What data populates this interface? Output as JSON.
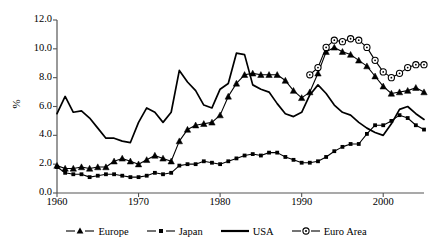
{
  "chart_data": {
    "type": "line",
    "title": "",
    "subtitle": "",
    "xlabel": "",
    "ylabel": "%",
    "xlim": [
      1960,
      2005
    ],
    "ylim": [
      0.0,
      12.0
    ],
    "grid": false,
    "legend_position": "bottom",
    "y_ticks": [
      "0.0",
      "2.0",
      "4.0",
      "6.0",
      "8.0",
      "10.0",
      "12.0"
    ],
    "y_tick_values": [
      0.0,
      2.0,
      4.0,
      6.0,
      8.0,
      10.0,
      12.0
    ],
    "x_ticks": [
      "1960",
      "1970",
      "1980",
      "1990",
      "2000"
    ],
    "x_tick_values": [
      1960,
      1970,
      1980,
      1990,
      2000
    ],
    "series": [
      {
        "name": "Europe",
        "marker": "triangle",
        "color": "#000000",
        "x": [
          1960,
          1961,
          1962,
          1963,
          1964,
          1965,
          1966,
          1967,
          1968,
          1969,
          1970,
          1971,
          1972,
          1973,
          1974,
          1975,
          1976,
          1977,
          1978,
          1979,
          1980,
          1981,
          1982,
          1983,
          1984,
          1985,
          1986,
          1987,
          1988,
          1989,
          1990,
          1991,
          1992,
          1993,
          1994,
          1995,
          1996,
          1997,
          1998,
          1999,
          2000,
          2001,
          2002,
          2003,
          2004,
          2005
        ],
        "values": [
          1.9,
          1.7,
          1.7,
          1.8,
          1.7,
          1.8,
          1.8,
          2.2,
          2.4,
          2.2,
          2.0,
          2.3,
          2.6,
          2.4,
          2.2,
          3.6,
          4.4,
          4.7,
          4.8,
          4.9,
          5.4,
          6.7,
          7.6,
          8.2,
          8.3,
          8.2,
          8.2,
          8.2,
          7.8,
          7.1,
          6.6,
          7.0,
          8.3,
          9.8,
          10.1,
          9.8,
          9.6,
          9.2,
          8.8,
          8.1,
          7.4,
          6.9,
          7.0,
          7.1,
          7.3,
          7.0
        ]
      },
      {
        "name": "Japan",
        "marker": "small-square",
        "color": "#000000",
        "x": [
          1960,
          1961,
          1962,
          1963,
          1964,
          1965,
          1966,
          1967,
          1968,
          1969,
          1970,
          1971,
          1972,
          1973,
          1974,
          1975,
          1976,
          1977,
          1978,
          1979,
          1980,
          1981,
          1982,
          1983,
          1984,
          1985,
          1986,
          1987,
          1988,
          1989,
          1990,
          1991,
          1992,
          1993,
          1994,
          1995,
          1996,
          1997,
          1998,
          1999,
          2000,
          2001,
          2002,
          2003,
          2004,
          2005
        ],
        "values": [
          1.8,
          1.4,
          1.3,
          1.3,
          1.1,
          1.2,
          1.3,
          1.3,
          1.2,
          1.1,
          1.1,
          1.2,
          1.4,
          1.3,
          1.4,
          1.9,
          2.0,
          2.0,
          2.2,
          2.1,
          2.0,
          2.2,
          2.4,
          2.6,
          2.7,
          2.6,
          2.8,
          2.8,
          2.5,
          2.3,
          2.1,
          2.1,
          2.2,
          2.5,
          2.9,
          3.2,
          3.4,
          3.4,
          4.1,
          4.7,
          4.7,
          5.0,
          5.4,
          5.2,
          4.7,
          4.4
        ]
      },
      {
        "name": "USA",
        "marker": "none",
        "color": "#000000",
        "x": [
          1960,
          1961,
          1962,
          1963,
          1964,
          1965,
          1966,
          1967,
          1968,
          1969,
          1970,
          1971,
          1972,
          1973,
          1974,
          1975,
          1976,
          1977,
          1978,
          1979,
          1980,
          1981,
          1982,
          1983,
          1984,
          1985,
          1986,
          1987,
          1988,
          1989,
          1990,
          1991,
          1992,
          1993,
          1994,
          1995,
          1996,
          1997,
          1998,
          1999,
          2000,
          2001,
          2002,
          2003,
          2004,
          2005
        ],
        "values": [
          5.5,
          6.7,
          5.6,
          5.7,
          5.2,
          4.5,
          3.8,
          3.8,
          3.6,
          3.5,
          4.9,
          5.9,
          5.6,
          4.9,
          5.6,
          8.5,
          7.7,
          7.1,
          6.1,
          5.9,
          7.2,
          7.6,
          9.7,
          9.6,
          7.5,
          7.2,
          7.0,
          6.2,
          5.5,
          5.3,
          5.6,
          6.8,
          7.5,
          6.9,
          6.1,
          5.6,
          5.4,
          4.9,
          4.5,
          4.2,
          4.0,
          4.8,
          5.8,
          6.0,
          5.5,
          5.1
        ]
      },
      {
        "name": "Euro Area",
        "marker": "circle",
        "color": "#000000",
        "x": [
          1991,
          1992,
          1993,
          1994,
          1995,
          1996,
          1997,
          1998,
          1999,
          2000,
          2001,
          2002,
          2003,
          2004,
          2005
        ],
        "values": [
          8.2,
          8.7,
          10.1,
          10.6,
          10.5,
          10.7,
          10.6,
          10.1,
          9.2,
          8.4,
          8.0,
          8.3,
          8.7,
          8.9,
          8.9
        ]
      }
    ]
  },
  "legend": {
    "items": [
      {
        "label": "Europe",
        "marker": "triangle"
      },
      {
        "label": "Japan",
        "marker": "small-square"
      },
      {
        "label": "USA",
        "marker": "none"
      },
      {
        "label": "Euro Area",
        "marker": "circle"
      }
    ]
  }
}
